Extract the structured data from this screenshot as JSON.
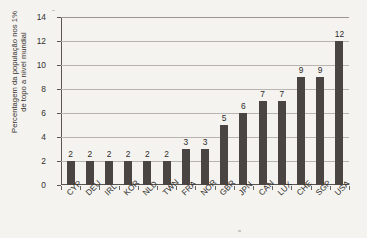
{
  "chart_data": {
    "type": "bar",
    "title": "",
    "xlabel": "",
    "ylabel": "Percentagem da população nos 1% de topo a nível mundial",
    "ylabel_lines": [
      "Percentagem da população nos 1%",
      "de topo a nível mundial"
    ],
    "categories": [
      "CYP",
      "DEU",
      "IRL",
      "KOR",
      "NLD",
      "TWN",
      "FRA",
      "NOR",
      "GBR",
      "JPN",
      "CAN",
      "LUX",
      "CHE",
      "SGP",
      "USA"
    ],
    "values": [
      2,
      2,
      2,
      2,
      2,
      2,
      3,
      3,
      5,
      6,
      7,
      7,
      9,
      9,
      12
    ],
    "data_labels": [
      "2",
      "2",
      "2",
      "2",
      "2",
      "2",
      "3",
      "3",
      "5",
      "6",
      "7",
      "7",
      "9",
      "9",
      "12"
    ],
    "ylim": [
      0,
      14
    ],
    "yticks": [
      0,
      2,
      4,
      6,
      8,
      10,
      12,
      14
    ],
    "ytick_labels": [
      "0",
      "2",
      "4",
      "6",
      "8",
      "10",
      "12",
      "14"
    ],
    "grid": true,
    "grid_axis": "y",
    "legend": null,
    "legend_position": "none",
    "bar_color": "#4a4543",
    "grid_color": "#b8b4b0",
    "axis_color": "#5b5551",
    "background_color": "#f4f3f0",
    "text_color": "#2e2b29"
  }
}
